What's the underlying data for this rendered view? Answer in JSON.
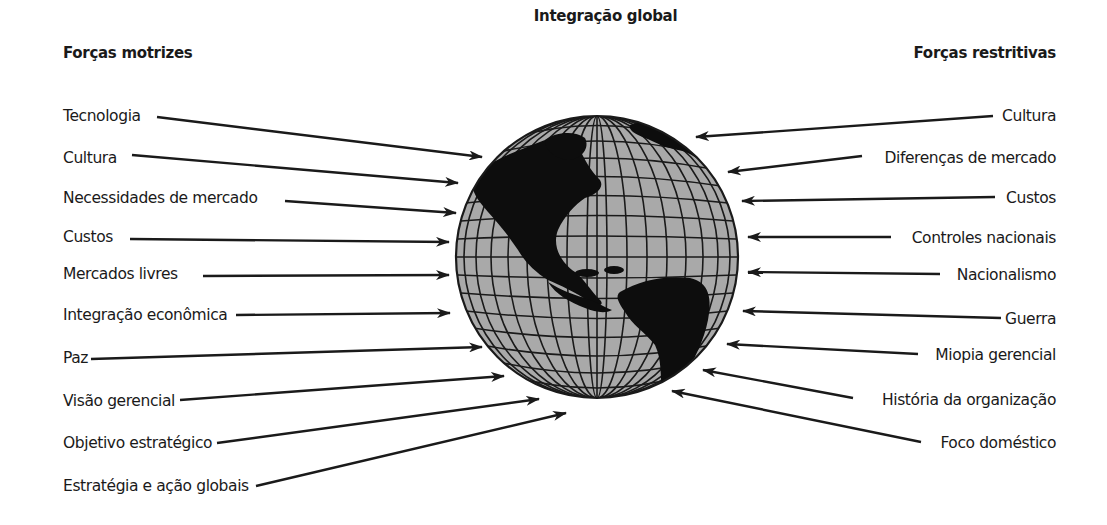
{
  "diagram": {
    "title": "Integração global",
    "left_heading": "Forças motrizes",
    "right_heading": "Forças restritivas",
    "center_icon": "globe-icon",
    "driving_forces": [
      {
        "label": "Tecnologia"
      },
      {
        "label": "Cultura"
      },
      {
        "label": "Necessidades de mercado"
      },
      {
        "label": "Custos"
      },
      {
        "label": "Mercados livres"
      },
      {
        "label": "Integração econômica"
      },
      {
        "label": "Paz"
      },
      {
        "label": "Visão gerencial"
      },
      {
        "label": "Objetivo estratégico"
      },
      {
        "label": "Estratégia e ação globais"
      }
    ],
    "restraining_forces": [
      {
        "label": "Cultura"
      },
      {
        "label": "Diferenças de mercado"
      },
      {
        "label": "Custos"
      },
      {
        "label": "Controles nacionais"
      },
      {
        "label": "Nacionalismo"
      },
      {
        "label": "Guerra"
      },
      {
        "label": "Miopia gerencial"
      },
      {
        "label": "História da organização"
      },
      {
        "label": "Foco doméstico"
      }
    ],
    "colors": {
      "globe_ocean": "#a9a9a9",
      "land": "#0d0d0d",
      "lines": "#1a1a1a",
      "text": "#1a1a1a"
    }
  }
}
